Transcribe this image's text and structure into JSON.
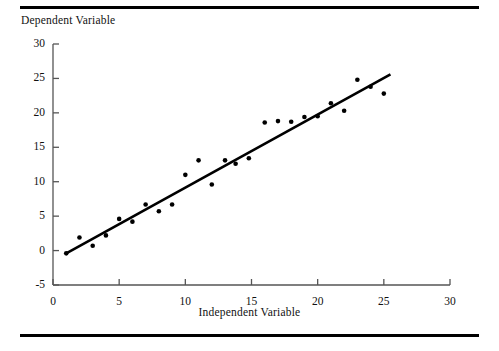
{
  "figure": {
    "top_rule": "horizontal-rule",
    "bottom_rule": "horizontal-rule"
  },
  "chart_data": {
    "type": "scatter",
    "title": "",
    "xlabel": "Independent Variable",
    "ylabel": "Dependent Variable",
    "xlim": [
      0,
      30
    ],
    "ylim": [
      -5,
      30
    ],
    "xticks": [
      0,
      5,
      10,
      15,
      20,
      25,
      30
    ],
    "xtick_labels": [
      "0",
      "5",
      "10",
      "15",
      "20",
      "25",
      "30"
    ],
    "yticks": [
      -5,
      0,
      5,
      10,
      15,
      20,
      25,
      30
    ],
    "ytick_labels": [
      "-5",
      "0",
      "5",
      "10",
      "15",
      "20",
      "25",
      "30"
    ],
    "grid": false,
    "legend": null,
    "marker": {
      "shape": "circle",
      "color": "#000000",
      "size_px": 4.6
    },
    "points": [
      {
        "x": 1.0,
        "y": -0.4
      },
      {
        "x": 2.0,
        "y": 1.9
      },
      {
        "x": 3.0,
        "y": 0.7
      },
      {
        "x": 4.0,
        "y": 2.2
      },
      {
        "x": 5.0,
        "y": 4.6
      },
      {
        "x": 6.0,
        "y": 4.2
      },
      {
        "x": 7.0,
        "y": 6.7
      },
      {
        "x": 8.0,
        "y": 5.7
      },
      {
        "x": 9.0,
        "y": 6.7
      },
      {
        "x": 10.0,
        "y": 11.0
      },
      {
        "x": 11.0,
        "y": 13.1
      },
      {
        "x": 12.0,
        "y": 9.6
      },
      {
        "x": 13.0,
        "y": 13.1
      },
      {
        "x": 13.8,
        "y": 12.6
      },
      {
        "x": 14.8,
        "y": 13.4
      },
      {
        "x": 16.0,
        "y": 18.6
      },
      {
        "x": 17.0,
        "y": 18.8
      },
      {
        "x": 18.0,
        "y": 18.7
      },
      {
        "x": 19.0,
        "y": 19.4
      },
      {
        "x": 20.0,
        "y": 19.5
      },
      {
        "x": 21.0,
        "y": 21.4
      },
      {
        "x": 22.0,
        "y": 20.3
      },
      {
        "x": 23.0,
        "y": 24.8
      },
      {
        "x": 24.0,
        "y": 23.8
      },
      {
        "x": 25.0,
        "y": 22.8
      }
    ],
    "fit_line": {
      "name": "least-squares regression line",
      "color": "#000000",
      "width_px": 2.6,
      "x_start": 1.0,
      "y_start": -0.4,
      "x_end": 25.5,
      "y_end": 25.6
    }
  },
  "axes": {
    "x_axis_name": "x-axis",
    "y_axis_name": "y-axis",
    "axis_color": "#555555"
  }
}
